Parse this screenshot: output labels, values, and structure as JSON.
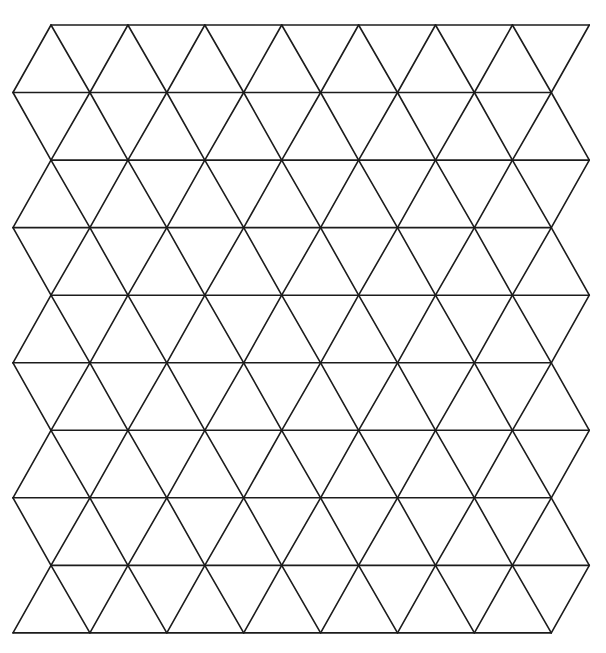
{
  "diagram": {
    "type": "triangular-grid",
    "background": "#ffffff",
    "line_color": "#1c1c1c",
    "line_width": 1.6,
    "rows": 9,
    "horizontal_lines": 10,
    "vertices_per_row": 8,
    "spacing_x": 76.9,
    "spacing_y": 67.55,
    "origin_y": 25,
    "even_row_start_x": 51,
    "odd_row_start_x": 13
  }
}
